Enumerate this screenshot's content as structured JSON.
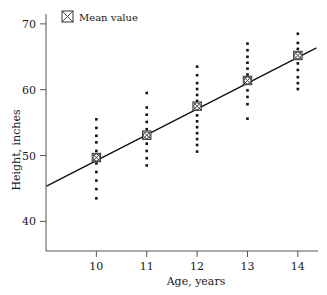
{
  "chart_data": {
    "type": "scatter",
    "title": "",
    "xlabel": "Age, years",
    "ylabel": "Height, inches",
    "xlim": [
      9.0,
      14.4
    ],
    "ylim": [
      35.5,
      71.5
    ],
    "xticks": [
      10,
      11,
      12,
      13,
      14
    ],
    "yticks": [
      40,
      50,
      60,
      70
    ],
    "xtick_labels": [
      "10",
      "11",
      "12",
      "13",
      "14"
    ],
    "ytick_labels": [
      "40",
      "50",
      "60",
      "70"
    ],
    "grid": false,
    "legend": {
      "position": "top-left",
      "entries": [
        {
          "label": "Mean value",
          "marker": "crossed-square-icon"
        }
      ]
    },
    "series": [
      {
        "name": "Observations",
        "marker": "dot",
        "points": [
          {
            "x": 10,
            "y": 43.5
          },
          {
            "x": 10,
            "y": 44.9
          },
          {
            "x": 10,
            "y": 46.2
          },
          {
            "x": 10,
            "y": 47.5
          },
          {
            "x": 10,
            "y": 48.8
          },
          {
            "x": 10,
            "y": 50.7
          },
          {
            "x": 10,
            "y": 52.0
          },
          {
            "x": 10,
            "y": 53.0
          },
          {
            "x": 10,
            "y": 54.2
          },
          {
            "x": 10,
            "y": 55.5
          },
          {
            "x": 11,
            "y": 48.5
          },
          {
            "x": 11,
            "y": 49.6
          },
          {
            "x": 11,
            "y": 50.7
          },
          {
            "x": 11,
            "y": 51.8
          },
          {
            "x": 11,
            "y": 52.6
          },
          {
            "x": 11,
            "y": 54.0
          },
          {
            "x": 11,
            "y": 55.1
          },
          {
            "x": 11,
            "y": 56.2
          },
          {
            "x": 11,
            "y": 57.3
          },
          {
            "x": 11,
            "y": 59.5
          },
          {
            "x": 12,
            "y": 50.6
          },
          {
            "x": 12,
            "y": 51.6
          },
          {
            "x": 12,
            "y": 52.5
          },
          {
            "x": 12,
            "y": 53.4
          },
          {
            "x": 12,
            "y": 54.3
          },
          {
            "x": 12,
            "y": 55.2
          },
          {
            "x": 12,
            "y": 56.1
          },
          {
            "x": 12,
            "y": 57.0
          },
          {
            "x": 12,
            "y": 58.3
          },
          {
            "x": 12,
            "y": 59.2
          },
          {
            "x": 12,
            "y": 60.1
          },
          {
            "x": 12,
            "y": 61.0
          },
          {
            "x": 12,
            "y": 62.2
          },
          {
            "x": 12,
            "y": 63.5
          },
          {
            "x": 13,
            "y": 55.6
          },
          {
            "x": 13,
            "y": 57.8
          },
          {
            "x": 13,
            "y": 58.9
          },
          {
            "x": 13,
            "y": 59.9
          },
          {
            "x": 13,
            "y": 62.3
          },
          {
            "x": 13,
            "y": 63.2
          },
          {
            "x": 13,
            "y": 64.1
          },
          {
            "x": 13,
            "y": 65.0
          },
          {
            "x": 13,
            "y": 66.0
          },
          {
            "x": 13,
            "y": 67.0
          },
          {
            "x": 14,
            "y": 60.1
          },
          {
            "x": 14,
            "y": 61.0
          },
          {
            "x": 14,
            "y": 61.9
          },
          {
            "x": 14,
            "y": 63.0
          },
          {
            "x": 14,
            "y": 64.0
          },
          {
            "x": 14,
            "y": 66.2
          },
          {
            "x": 14,
            "y": 67.1
          },
          {
            "x": 14,
            "y": 68.5
          }
        ]
      },
      {
        "name": "Mean value",
        "marker": "crossed-square",
        "points": [
          {
            "x": 10,
            "y": 49.7
          },
          {
            "x": 11,
            "y": 53.1
          },
          {
            "x": 12,
            "y": 57.5
          },
          {
            "x": 13,
            "y": 61.4
          },
          {
            "x": 14,
            "y": 65.2
          }
        ]
      }
    ],
    "fit_line": {
      "name": "Regression line",
      "x_start": 9.02,
      "y_start": 45.4,
      "x_end": 14.36,
      "y_end": 66.3
    },
    "colors": {
      "dot": "#111111",
      "line": "#111111",
      "axis": "#555555",
      "text": "#1a1a1a"
    }
  }
}
